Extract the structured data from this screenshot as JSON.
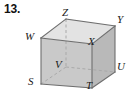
{
  "problem": {
    "number": "13."
  },
  "figure": {
    "type": "cube-net-solid",
    "colors": {
      "front_face": "#c9c9c9",
      "top_face": "#e2e2e2",
      "right_face": "#b8b8b8",
      "edge": "#6e6e6e",
      "hidden_edge": "#a8a8a8",
      "background": "#ffffff",
      "label": "#1a1a1a"
    },
    "vertices": [
      {
        "name": "Z",
        "label": "Z",
        "role": "top-back-left",
        "x": 66,
        "y": 19,
        "label_x": 62,
        "label_y": 7
      },
      {
        "name": "Y",
        "label": "Y",
        "role": "top-back-right",
        "x": 115,
        "y": 26,
        "label_x": 116,
        "label_y": 15
      },
      {
        "name": "W",
        "label": "W",
        "role": "top-front-left",
        "x": 41,
        "y": 38,
        "label_x": 25,
        "label_y": 31
      },
      {
        "name": "X",
        "label": "X",
        "role": "top-front-right",
        "x": 92,
        "y": 44,
        "label_x": 88,
        "label_y": 36
      },
      {
        "name": "V",
        "label": "V",
        "role": "bottom-back-left",
        "x": 66,
        "y": 67,
        "label_x": 55,
        "label_y": 59
      },
      {
        "name": "U",
        "label": "U",
        "role": "bottom-back-right",
        "x": 115,
        "y": 72,
        "label_x": 116,
        "label_y": 60
      },
      {
        "name": "S",
        "label": "S",
        "role": "bottom-front-left",
        "x": 41,
        "y": 84,
        "label_x": 28,
        "label_y": 75
      },
      {
        "name": "T",
        "label": "T",
        "role": "bottom-front-right",
        "x": 92,
        "y": 88,
        "label_x": 86,
        "label_y": 80
      }
    ],
    "visible_edges": [
      [
        "W",
        "X"
      ],
      [
        "X",
        "T"
      ],
      [
        "T",
        "S"
      ],
      [
        "S",
        "W"
      ],
      [
        "W",
        "Z"
      ],
      [
        "Z",
        "Y"
      ],
      [
        "Y",
        "X"
      ],
      [
        "Y",
        "U"
      ],
      [
        "U",
        "T"
      ]
    ],
    "hidden_edges": [
      [
        "Z",
        "V"
      ],
      [
        "V",
        "U"
      ],
      [
        "V",
        "S"
      ]
    ]
  }
}
